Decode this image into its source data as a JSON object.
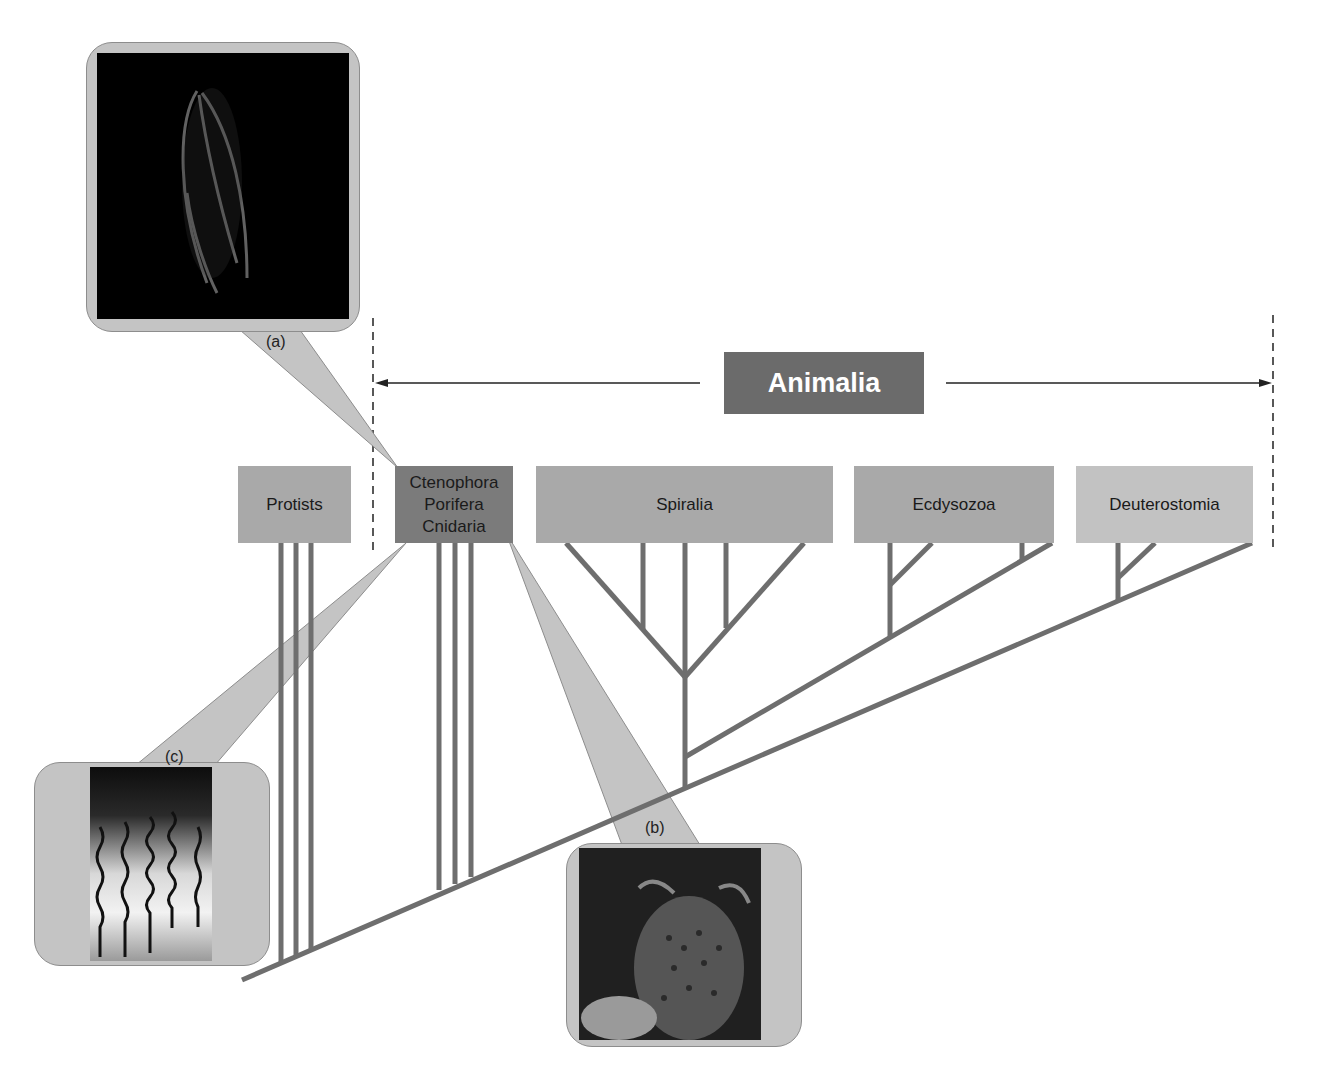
{
  "title": "Animalia",
  "clades": [
    {
      "id": "protists",
      "label": "Protists",
      "color": "#a9a9a9"
    },
    {
      "id": "basal",
      "label_lines": [
        "Ctenophora",
        "Porifera",
        "Cnidaria"
      ],
      "color": "#7b7b7b"
    },
    {
      "id": "spiralia",
      "label": "Spiralia",
      "color": "#a9a9a9"
    },
    {
      "id": "ecdysozoa",
      "label": "Ecdysozoa",
      "color": "#a9a9a9"
    },
    {
      "id": "deuterostomia",
      "label": "Deuterostomia",
      "color": "#c2c2c2"
    }
  ],
  "callouts": [
    {
      "label": "(a)",
      "depicts": "Ctenophora (comb jelly)",
      "photo_bg": "#000000"
    },
    {
      "label": "(b)",
      "depicts": "Porifera (sponge)",
      "photo_bg": "#202020"
    },
    {
      "label": "(c)",
      "depicts": "Cnidaria (jellyfish tentacles)",
      "photo_bg": "#111111"
    }
  ],
  "colors": {
    "branch": "#6e6e6e",
    "callout_fill": "#c4c4c4",
    "arrow": "#222222",
    "title_bg": "#6b6b6b"
  }
}
